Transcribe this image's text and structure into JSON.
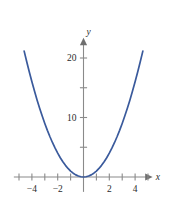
{
  "figure": {
    "background_color": "#ffffff",
    "axis_color": "#8a8a8a",
    "curve_color": "#3a5a9c",
    "label_color": "#2b2b2b",
    "x_axis_name": "x",
    "y_axis_name": "y"
  },
  "chart_data": {
    "type": "line",
    "title": "",
    "subtitle": "",
    "xlabel": "x",
    "ylabel": "y",
    "equation": "y = x^2",
    "xlim": [
      -5.4,
      5.4
    ],
    "ylim": [
      -2.5,
      23.5
    ],
    "grid": false,
    "legend": null,
    "legend_position": "none",
    "x_ticks": [
      -5,
      -4,
      -3,
      -2,
      -1,
      1,
      2,
      3,
      4,
      5
    ],
    "x_tick_labels": [
      "",
      "−4",
      "",
      "−2",
      "",
      "",
      "2",
      "",
      "4",
      ""
    ],
    "y_ticks": [
      5,
      10,
      15,
      20
    ],
    "y_tick_labels": [
      "",
      "10",
      "",
      "20"
    ],
    "series": [
      {
        "name": "y = x^2",
        "color": "#3a5a9c",
        "x": [
          -4.6,
          -4.4,
          -4.2,
          -4.0,
          -3.8,
          -3.6,
          -3.4,
          -3.2,
          -3.0,
          -2.8,
          -2.6,
          -2.4,
          -2.2,
          -2.0,
          -1.8,
          -1.6,
          -1.4,
          -1.2,
          -1.0,
          -0.8,
          -0.6,
          -0.4,
          -0.2,
          0.0,
          0.2,
          0.4,
          0.6,
          0.8,
          1.0,
          1.2,
          1.4,
          1.6,
          1.8,
          2.0,
          2.2,
          2.4,
          2.6,
          2.8,
          3.0,
          3.2,
          3.4,
          3.6,
          3.8,
          4.0,
          4.2,
          4.4,
          4.6
        ],
        "y": [
          21.16,
          19.36,
          17.64,
          16.0,
          14.44,
          12.96,
          11.56,
          10.24,
          9.0,
          7.84,
          6.76,
          5.76,
          4.84,
          4.0,
          3.24,
          2.56,
          1.96,
          1.44,
          1.0,
          0.64,
          0.36,
          0.16,
          0.04,
          0.0,
          0.04,
          0.16,
          0.36,
          0.64,
          1.0,
          1.44,
          1.96,
          2.56,
          3.24,
          4.0,
          4.84,
          5.76,
          6.76,
          7.84,
          9.0,
          10.24,
          11.56,
          12.96,
          14.44,
          16.0,
          17.64,
          19.36,
          21.16
        ]
      }
    ]
  }
}
